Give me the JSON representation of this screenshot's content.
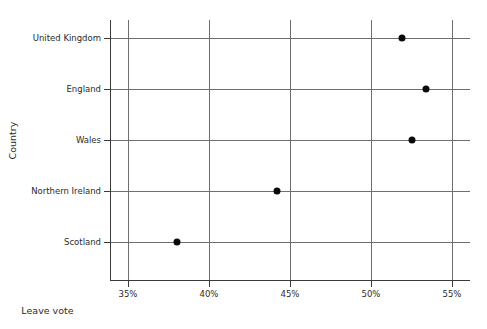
{
  "chart_data": {
    "type": "scatter",
    "title": "",
    "xlabel": "Leave vote",
    "ylabel": "Country",
    "categories": [
      "United Kingdom",
      "England",
      "Wales",
      "Northern Ireland",
      "Scotland"
    ],
    "values": [
      51.9,
      53.4,
      52.5,
      44.2,
      38.0
    ],
    "value_labels": [
      "51.9%",
      "53.4%",
      "52.5%",
      "44.2%",
      "38.0%"
    ],
    "xlim": [
      33.0,
      55.2
    ],
    "xticks": [
      35,
      40,
      45,
      50,
      55
    ],
    "xtick_labels": [
      "35%",
      "40%",
      "45%",
      "50%",
      "55%"
    ],
    "grid": "vertical-and-row-lines",
    "legend": "none",
    "marker": "filled-circle",
    "marker_color": "#0a0a0a",
    "grid_color": "#6e6e6e",
    "axis_color": "#3a3a3a",
    "background": "#ffffff"
  },
  "axes": {
    "x_title": "Leave vote",
    "y_title": "Country"
  },
  "x_ticks": [
    {
      "label": "35%",
      "value": 35
    },
    {
      "label": "40%",
      "value": 40
    },
    {
      "label": "45%",
      "value": 45
    },
    {
      "label": "50%",
      "value": 50
    },
    {
      "label": "55%",
      "value": 55
    }
  ],
  "rows": [
    {
      "label": "United Kingdom",
      "value": 51.9
    },
    {
      "label": "England",
      "value": 53.4
    },
    {
      "label": "Wales",
      "value": 52.5
    },
    {
      "label": "Northern Ireland",
      "value": 44.2
    },
    {
      "label": "Scotland",
      "value": 38.0
    }
  ]
}
